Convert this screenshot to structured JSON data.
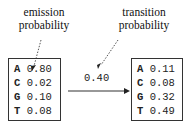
{
  "labels": {
    "emission": [
      "emission",
      "probability"
    ],
    "transition": [
      "transition",
      "probability"
    ]
  },
  "transition_value": "0.40",
  "states": [
    {
      "rows": [
        {
          "base": "A",
          "value": "0.80"
        },
        {
          "base": "C",
          "value": "0.02"
        },
        {
          "base": "G",
          "value": "0.10"
        },
        {
          "base": "T",
          "value": "0.08"
        }
      ]
    },
    {
      "rows": [
        {
          "base": "A",
          "value": "0.11"
        },
        {
          "base": "C",
          "value": "0.08"
        },
        {
          "base": "G",
          "value": "0.32"
        },
        {
          "base": "T",
          "value": "0.49"
        }
      ]
    }
  ],
  "colors": {
    "line": "#333333",
    "dotted": "#555555"
  }
}
